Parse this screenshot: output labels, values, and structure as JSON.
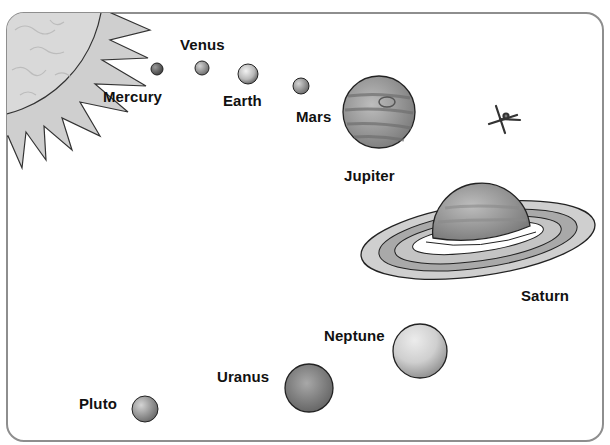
{
  "diagram": {
    "type": "solar-system-illustration",
    "colors": {
      "frame": "#8e8e8e",
      "sun_fill": "#d8d8d8",
      "outline": "#2a2a2a",
      "label": "#111111"
    },
    "sun": {
      "label": null
    },
    "planets": [
      {
        "name": "Mercury",
        "label": "Mercury",
        "order": 1
      },
      {
        "name": "Venus",
        "label": "Venus",
        "order": 2
      },
      {
        "name": "Earth",
        "label": "Earth",
        "order": 3
      },
      {
        "name": "Mars",
        "label": "Mars",
        "order": 4
      },
      {
        "name": "Jupiter",
        "label": "Jupiter",
        "order": 5
      },
      {
        "name": "Saturn",
        "label": "Saturn",
        "order": 6
      },
      {
        "name": "Uranus",
        "label": "Uranus",
        "order": 7
      },
      {
        "name": "Neptune",
        "label": "Neptune",
        "order": 8
      },
      {
        "name": "Pluto",
        "label": "Pluto",
        "order": 9
      }
    ],
    "extras": [
      {
        "name": "satellite",
        "label": null
      }
    ]
  }
}
